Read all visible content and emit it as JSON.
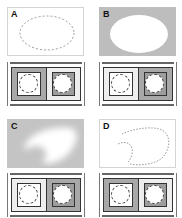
{
  "colors": {
    "selected_gray": "#b5b5b5",
    "frame_dark": "#333333",
    "background": "#ffffff",
    "swatch_white": "#ffffff"
  },
  "panels": [
    {
      "label": "A",
      "description": "Marching-ants elliptical selection on white canvas",
      "background": "#ffffff",
      "selection": "dashed-ellipse",
      "widget": {
        "left": {
          "outer": "#a8a8a8",
          "inner": "#ffffff"
        },
        "right": {
          "outer": "#eeeeee",
          "inner": "#9d9d9d"
        }
      }
    },
    {
      "label": "B",
      "description": "White ellipse mask on gray background",
      "background": "#bdbdbd",
      "selection": "solid-white-ellipse",
      "widget": {
        "left": {
          "outer": "#eeeeee",
          "inner": "#ffffff"
        },
        "right": {
          "outer": "#a8a8a8",
          "inner": "#9d9d9d"
        }
      }
    },
    {
      "label": "C",
      "description": "Soft feathered white mask on gray background",
      "background": "#c4c4c4",
      "selection": "feathered-blob",
      "widget": {
        "left": {
          "outer": "#eeeeee",
          "inner": "#ffffff"
        },
        "right": {
          "outer": "#a8a8a8",
          "inner": "#9d9d9d"
        }
      }
    },
    {
      "label": "D",
      "description": "Irregular marching-ants selection on white canvas",
      "background": "#ffffff",
      "selection": "dashed-irregular",
      "widget": {
        "left": {
          "outer": "#a8a8a8",
          "inner": "#ffffff"
        },
        "right": {
          "outer": "#eeeeee",
          "inner": "#9d9d9d"
        }
      }
    }
  ]
}
